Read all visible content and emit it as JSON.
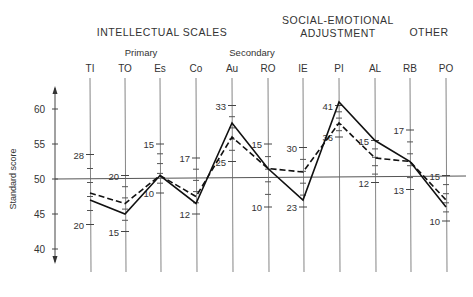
{
  "chart_data": {
    "type": "line",
    "title": "",
    "ylabel": "Standard score",
    "xlabel": "",
    "ylim": [
      35,
      65
    ],
    "y_ticks": [
      40,
      45,
      50,
      55,
      60
    ],
    "reference_line": 50,
    "groups": [
      {
        "label": "INTELLECTUAL SCALES",
        "sub": [
          {
            "label": "Primary"
          },
          {
            "label": "Secondary"
          }
        ]
      },
      {
        "label": "SOCIAL-EMOTIONAL ADJUSTMENT"
      },
      {
        "label": "OTHER"
      }
    ],
    "categories": [
      "TI",
      "TO",
      "Es",
      "Co",
      "Au",
      "RO",
      "IE",
      "PI",
      "AL",
      "RB",
      "PO"
    ],
    "raw_score_labels": [
      {
        "axis": "TI",
        "labels": [
          {
            "value": "28",
            "score": 53.5
          },
          {
            "value": "20",
            "score": 43.5
          }
        ]
      },
      {
        "axis": "TO",
        "labels": [
          {
            "value": "20",
            "score": 50.5
          },
          {
            "value": "15",
            "score": 42.5
          }
        ]
      },
      {
        "axis": "Es",
        "labels": [
          {
            "value": "15",
            "score": 55
          },
          {
            "value": "10",
            "score": 48
          }
        ]
      },
      {
        "axis": "Co",
        "labels": [
          {
            "value": "17",
            "score": 53
          },
          {
            "value": "12",
            "score": 45
          }
        ]
      },
      {
        "axis": "Au",
        "labels": [
          {
            "value": "33",
            "score": 60.5
          },
          {
            "value": "25",
            "score": 52.5
          }
        ]
      },
      {
        "axis": "RO",
        "labels": [
          {
            "value": "15",
            "score": 55
          },
          {
            "value": "10",
            "score": 46
          }
        ]
      },
      {
        "axis": "IE",
        "labels": [
          {
            "value": "30",
            "score": 54.5
          },
          {
            "value": "23",
            "score": 46
          }
        ]
      },
      {
        "axis": "PI",
        "labels": [
          {
            "value": "41",
            "score": 60.5
          },
          {
            "value": "36",
            "score": 56
          }
        ]
      },
      {
        "axis": "AL",
        "labels": [
          {
            "value": "15",
            "score": 55.5
          },
          {
            "value": "12",
            "score": 49.5
          }
        ]
      },
      {
        "axis": "RB",
        "labels": [
          {
            "value": "17",
            "score": 57
          },
          {
            "value": "13",
            "score": 48.5
          }
        ]
      },
      {
        "axis": "PO",
        "labels": [
          {
            "value": "15",
            "score": 50.5
          },
          {
            "value": "10",
            "score": 44
          }
        ]
      }
    ],
    "series": [
      {
        "name": "Solid profile",
        "style": "solid",
        "values": [
          47,
          45,
          50.5,
          46.5,
          58,
          51.5,
          47,
          61,
          55.5,
          52.5,
          46
        ]
      },
      {
        "name": "Dashed profile",
        "style": "dashed",
        "values": [
          48,
          46.5,
          50.5,
          47.5,
          56,
          51.5,
          51,
          58,
          53,
          52.5,
          47
        ]
      }
    ],
    "grid": false,
    "legend": null
  }
}
